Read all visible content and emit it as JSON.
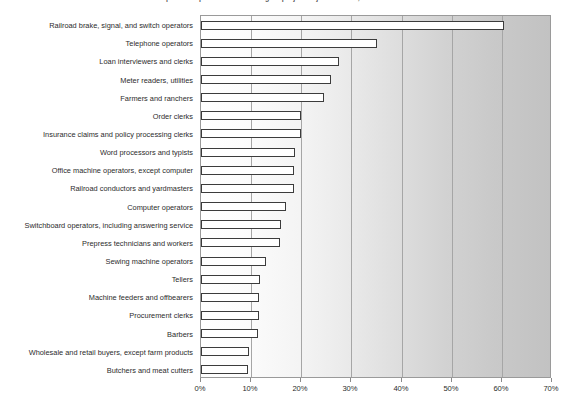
{
  "chart_data": {
    "type": "bar",
    "orientation": "horizontal",
    "title": "Top 20 occupations with the largest projected job declines, 2004-2014",
    "xlabel": "",
    "ylabel": "",
    "xlim": [
      0,
      70
    ],
    "xticks": [
      "0%",
      "10%",
      "20%",
      "30%",
      "40%",
      "50%",
      "60%",
      "70%"
    ],
    "xtick_values": [
      0,
      10,
      20,
      30,
      40,
      50,
      60,
      70
    ],
    "grid": true,
    "legend": "none",
    "value_unit": "%",
    "categories": [
      "Railroad brake, signal, and switch operators",
      "Telephone operators",
      "Loan interviewers and clerks",
      "Meter readers, utilities",
      "Farmers and ranchers",
      "Order clerks",
      "Insurance claims and policy processing clerks",
      "Word processors and typists",
      "Office machine operators, except computer",
      "Railroad conductors and yardmasters",
      "Computer operators",
      "Switchboard operators, including answering service",
      "Prepress technicians and workers",
      "Sewing machine operators",
      "Tellers",
      "Machine feeders and offbearers",
      "Procurement clerks",
      "Barbers",
      "Wholesale and retail buyers, except farm products",
      "Butchers and meat cutters"
    ],
    "values": [
      60.5,
      35.0,
      27.5,
      26.0,
      24.5,
      20.0,
      20.0,
      18.8,
      18.5,
      18.5,
      17.0,
      16.0,
      15.8,
      13.0,
      11.8,
      11.6,
      11.5,
      11.4,
      9.5,
      9.4
    ]
  },
  "style": {
    "bar_fill": "#ffffff",
    "bar_stroke": "#3c3c3c",
    "gridline_color": "#a6a6a6",
    "plot_border": "#9a9a9a",
    "text_color": "#2b2b2b",
    "background": "#ffffff"
  }
}
